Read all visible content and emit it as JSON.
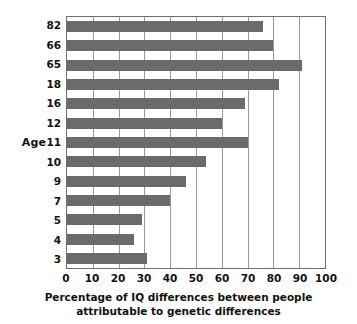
{
  "chart_data": {
    "type": "bar",
    "orientation": "horizontal",
    "title": "",
    "xlabel": "Percentage of IQ differences between people attributable to genetic differences",
    "xlabel_lines": [
      "Percentage of IQ differences between people",
      "attributable to genetic differences"
    ],
    "ylabel": "Age",
    "categories": [
      "82",
      "66",
      "65",
      "18",
      "16",
      "12",
      "11",
      "10",
      "9",
      "7",
      "5",
      "4",
      "3"
    ],
    "values": [
      76,
      80,
      91,
      82,
      69,
      60,
      70,
      54,
      46,
      40,
      29,
      26,
      31
    ],
    "xlim": [
      0,
      100
    ],
    "xticks": [
      "0",
      "10",
      "20",
      "30",
      "40",
      "50",
      "60",
      "70",
      "80",
      "90",
      "100"
    ],
    "xtick_values": [
      0,
      10,
      20,
      30,
      40,
      50,
      60,
      70,
      80,
      90,
      100
    ],
    "grid": "vertical",
    "legend": "none",
    "bar_color": "#6b6b6b",
    "axis_color": "#6f6f6f",
    "gridline_color": "#9a9a9a",
    "background": "#ffffff"
  }
}
